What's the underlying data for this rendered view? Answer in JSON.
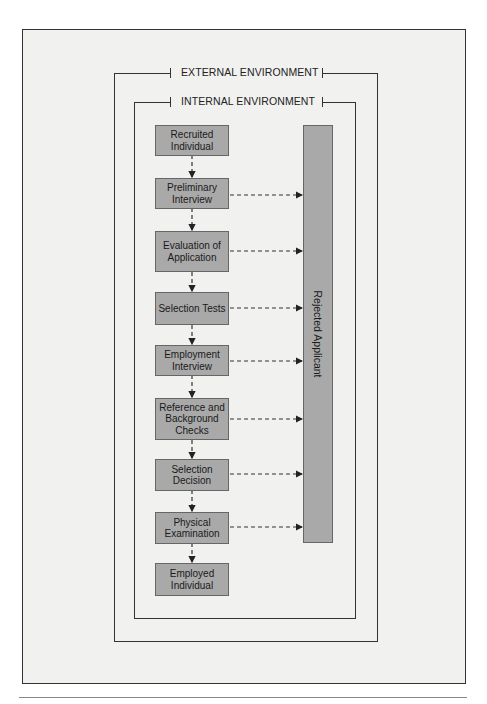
{
  "diagram": {
    "external_environment_label": "EXTERNAL ENVIRONMENT",
    "internal_environment_label": "INTERNAL ENVIRONMENT",
    "rejected_label": "Rejected Applicant",
    "colors": {
      "frame_bg": "#f1f1f0",
      "box_fill": "#a9a9a9",
      "line": "#333333"
    },
    "steps": [
      {
        "label": "Recruited Individual",
        "rejects": false
      },
      {
        "label": "Preliminary Interview",
        "rejects": true
      },
      {
        "label": "Evaluation of Application",
        "rejects": true
      },
      {
        "label": "Selection Tests",
        "rejects": true
      },
      {
        "label": "Employment Interview",
        "rejects": true
      },
      {
        "label": "Reference and Background Checks",
        "rejects": true
      },
      {
        "label": "Selection Decision",
        "rejects": true
      },
      {
        "label": "Physical Examination",
        "rejects": true
      },
      {
        "label": "Employed Individual",
        "rejects": false
      }
    ]
  }
}
